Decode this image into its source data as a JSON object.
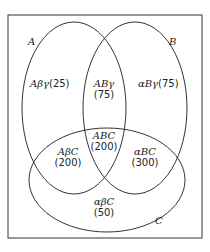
{
  "diagram": {
    "type": "venn",
    "sets": [
      {
        "name": "A",
        "label": "A"
      },
      {
        "name": "B",
        "label": "B"
      },
      {
        "name": "C",
        "label": "C"
      }
    ],
    "regions": [
      {
        "id": "A_only",
        "label": "Aβγ",
        "count": "(25)"
      },
      {
        "id": "AB_only",
        "label": "ABγ",
        "count": "(75)"
      },
      {
        "id": "B_only",
        "label": "αBγ",
        "count": "(75)"
      },
      {
        "id": "ABC",
        "label": "ABC",
        "count": "(200)"
      },
      {
        "id": "AC_only",
        "label": "AβC",
        "count": "(200)"
      },
      {
        "id": "BC_only",
        "label": "αBC",
        "count": "(300)"
      },
      {
        "id": "C_only",
        "label": "αβC",
        "count": "(50)"
      }
    ],
    "colors": {
      "line": "#333333",
      "background": "#ffffff"
    }
  }
}
